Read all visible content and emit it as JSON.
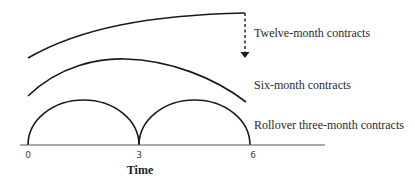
{
  "diagram": {
    "labels": {
      "twelve": "Twelve-month contracts",
      "six": "Six-month contracts",
      "three": "Rollover three-month contracts"
    },
    "axis": {
      "title": "Time",
      "ticks": [
        "0",
        "3",
        "6"
      ]
    },
    "colors": {
      "line": "#1a1a1a",
      "text": "#2a2a2a"
    }
  }
}
